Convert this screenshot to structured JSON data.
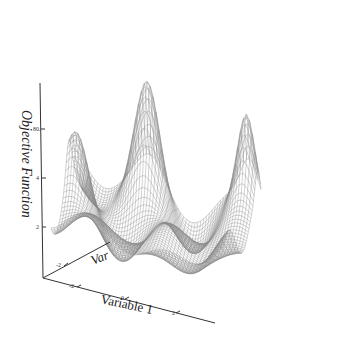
{
  "chart_data": {
    "type": "surface3d",
    "title": "",
    "zlabel": "Objective Function",
    "xlabel": "Variable 1",
    "ylabel": "Variable 2",
    "ylabel_visible_text": "Var",
    "x_ticks": [
      "-2",
      "0",
      "2"
    ],
    "y_ticks": [
      "-2"
    ],
    "z_ticks": [
      "2",
      "4",
      "80."
    ],
    "xlim": [
      -3,
      3
    ],
    "ylim": [
      -3,
      3
    ],
    "style": "wireframe mesh, grayscale",
    "grid": false,
    "legend": null,
    "peaks": [
      {
        "label": "back-center tall peak",
        "approx_height": "max"
      },
      {
        "label": "right-edge spike",
        "approx_height": "high"
      },
      {
        "label": "left-edge peak",
        "approx_height": "medium"
      }
    ]
  },
  "colors": {
    "mesh": "#8a8a8a",
    "mesh_dark": "#4a4a4a",
    "axis": "#333333",
    "background": "#ffffff"
  }
}
